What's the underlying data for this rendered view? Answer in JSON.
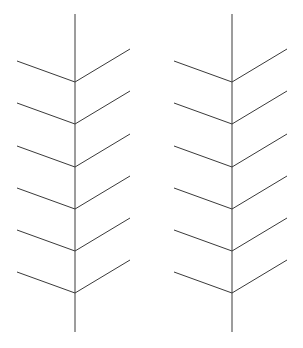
{
  "canvas": {
    "width": 303,
    "height": 348,
    "background_color": "#ffffff",
    "line_color": "#3a3a3a",
    "line_width": 1
  },
  "diagram": {
    "name": "chevron-herringbone-pair",
    "figure_count": 2,
    "branches_per_figure": 6
  },
  "figures": [
    {
      "id": "left-figure",
      "label": "Left chevron figure",
      "stem": {
        "x": 75,
        "y_top": 14,
        "y_bottom": 332
      },
      "branch_vertices_y": [
        82,
        124,
        167,
        209,
        251,
        293
      ],
      "left_arm_offset": {
        "dx": -58,
        "dy": -21
      },
      "right_arm_offset": {
        "dx": 55,
        "dy": -33
      }
    },
    {
      "id": "right-figure",
      "label": "Right chevron figure",
      "stem": {
        "x": 232,
        "y_top": 14,
        "y_bottom": 332
      },
      "branch_vertices_y": [
        82,
        124,
        167,
        209,
        251,
        293
      ],
      "left_arm_offset": {
        "dx": -58,
        "dy": -21
      },
      "right_arm_offset": {
        "dx": 55,
        "dy": -33
      }
    }
  ]
}
